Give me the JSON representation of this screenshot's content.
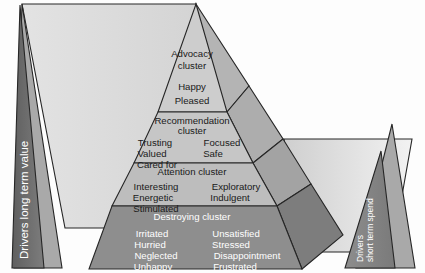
{
  "diagram": {
    "type": "pyramid",
    "left_axis_label": "Drivers long term value",
    "right_axis_label_line1": "Drivers",
    "right_axis_label_line2": "short term spend",
    "levels": [
      {
        "id": "advocacy",
        "name": "Advocacy cluster",
        "name_line1": "Advocacy",
        "name_line2": "cluster",
        "fill": "#cdcdcd",
        "side_fill": "#b4b4b4",
        "text_color": "#1a1a1a",
        "col_left": [
          "Happy",
          "Pleased"
        ],
        "col_right": []
      },
      {
        "id": "recommendation",
        "name": "Recommendation cluster",
        "name_line1": "Recommendation",
        "name_line2": "cluster",
        "fill": "#c6c6c6",
        "side_fill": "#adadad",
        "text_color": "#1a1a1a",
        "col_left": [
          "Trusting",
          "Valued",
          "Cared for"
        ],
        "col_right": [
          "Focused",
          "Safe"
        ]
      },
      {
        "id": "attention",
        "name": "Attention cluster",
        "name_line1": "Attention cluster",
        "name_line2": "",
        "fill": "#bdbdbd",
        "side_fill": "#a3a3a3",
        "text_color": "#1a1a1a",
        "col_left": [
          "Interesting",
          "Energetic",
          "Stimulated"
        ],
        "col_right": [
          "Exploratory",
          "Indulgent"
        ]
      },
      {
        "id": "destroying",
        "name": "Destroying cluster",
        "name_line1": "Destroying cluster",
        "name_line2": "",
        "fill": "#8e8e8e",
        "side_fill": "#7d7d7d",
        "text_color": "#ffffff",
        "col_left": [
          "Irritated",
          "Hurried",
          "Neglected",
          "Unhappy"
        ],
        "col_right": [
          "Unsatisfied",
          "Stressed",
          "Disappointment",
          "Frustrated"
        ]
      }
    ],
    "colors": {
      "outline": "#262626",
      "left_backdrop": "#dcdcdc",
      "left_mid": "#a9a9a9",
      "left_dark": "#6f6f6f",
      "right_backdrop": "#d2d2d2",
      "right_mid": "#a9a9a9",
      "right_dark": "#848484",
      "background": "#fdfdfd"
    }
  }
}
